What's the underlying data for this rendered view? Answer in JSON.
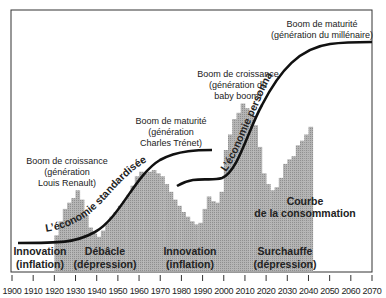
{
  "chart_data": {
    "type": "area",
    "title": "",
    "xlabel": "",
    "ylabel": "",
    "x_axis": {
      "range": [
        1900,
        2070
      ],
      "ticks": [
        1900,
        1910,
        1920,
        1930,
        1940,
        1950,
        1960,
        1970,
        1980,
        1990,
        2000,
        2010,
        2020,
        2030,
        2040,
        2050,
        2060,
        2070
      ],
      "tick_labels": [
        "1900",
        "1910",
        "1920",
        "1930",
        "1940",
        "1950",
        "1960",
        "1970",
        "1980",
        "1990",
        "2000",
        "2010",
        "2020",
        "2030",
        "2040",
        "2050",
        "2060",
        "2070"
      ]
    },
    "grid": false,
    "series": [
      {
        "name": "Courbe de la consommation",
        "kind": "stepped-area",
        "color": "#a8a8a8",
        "note": "relative height (0-100), read visually",
        "x": [
          1920,
          1922,
          1924,
          1926,
          1928,
          1930,
          1932,
          1934,
          1936,
          1938,
          1940,
          1942,
          1944,
          1946,
          1948,
          1950,
          1952,
          1954,
          1956,
          1958,
          1960,
          1962,
          1964,
          1966,
          1968,
          1970,
          1972,
          1974,
          1976,
          1978,
          1980,
          1982,
          1984,
          1986,
          1988,
          1990,
          1992,
          1994,
          1996,
          1998,
          2000,
          2002,
          2004,
          2006,
          2008,
          2010,
          2012,
          2014,
          2016,
          2018,
          2020,
          2022,
          2024,
          2026,
          2028,
          2030,
          2032,
          2034,
          2036,
          2038,
          2040
        ],
        "values": [
          5,
          14,
          22,
          26,
          29,
          34,
          28,
          18,
          10,
          6,
          4,
          8,
          13,
          17,
          20,
          24,
          27,
          31,
          37,
          43,
          46,
          45,
          46,
          47,
          45,
          43,
          38,
          33,
          28,
          24,
          20,
          17,
          14,
          12,
          13,
          22,
          30,
          27,
          26,
          33,
          60,
          70,
          80,
          84,
          90,
          87,
          84,
          76,
          62,
          45,
          38,
          34,
          36,
          42,
          51,
          54,
          56,
          63,
          66,
          70,
          75
        ]
      },
      {
        "name": "L'économie standardisée",
        "kind": "s-curve",
        "color": "#111111",
        "x": [
          1903,
          1915,
          1925,
          1935,
          1945,
          1955,
          1965,
          1975,
          1985,
          1991
        ],
        "values": [
          4,
          5,
          8,
          16,
          32,
          48,
          56,
          58,
          58,
          58
        ]
      },
      {
        "name": "L'économie personnalisée",
        "kind": "s-curve",
        "color": "#111111",
        "x": [
          1972,
          1980,
          1990,
          2000,
          2010,
          2020,
          2030,
          2040,
          2050,
          2060,
          2068
        ],
        "values": [
          30,
          27,
          30,
          40,
          58,
          80,
          98,
          110,
          116,
          118,
          118
        ]
      }
    ],
    "annotations": [
      {
        "text": "Boom de croissance (génération Louis Renault)",
        "x": 1930
      },
      {
        "text": "Boom de maturité (génération Charles Trénet)",
        "x": 1968
      },
      {
        "text": "Boom de croissance (génération du baby boom)",
        "x": 2006
      },
      {
        "text": "Boom de maturité (génération du millénaire)",
        "x": 2054
      },
      {
        "text": "Innovation (inflation)",
        "x": 1910
      },
      {
        "text": "Débâcle (dépression)",
        "x": 1938
      },
      {
        "text": "Innovation (inflation)",
        "x": 1980
      },
      {
        "text": "Surchauffe (dépression)",
        "x": 2031
      },
      {
        "text": "Courbe de la consommation",
        "x": 2042
      }
    ]
  },
  "labels": {
    "boom1": [
      "Boom de croissance",
      "(génération",
      "Louis Renault)"
    ],
    "boom2": [
      "Boom de maturité",
      "(génération",
      "Charles Trénet)"
    ],
    "boom3": [
      "Boom de croissance",
      "(génération du",
      "baby boom)"
    ],
    "boom4": [
      "Boom de maturité",
      "(génération du millénaire)"
    ],
    "phase1": [
      "Innovation",
      "(inflation)"
    ],
    "phase2": [
      "Débâcle",
      "(dépression)"
    ],
    "phase3": [
      "Innovation",
      "(inflation)"
    ],
    "phase4": [
      "Surchauffe",
      "(dépression)"
    ],
    "consumption": [
      "Courbe",
      "de la consommation"
    ],
    "curve_standard": "L’économie standardisée",
    "curve_personal": "L’économie personnalisée"
  },
  "colors": {
    "bars": "#a9a9a9",
    "curve": "#111111",
    "frame": "#333333",
    "text": "#222222"
  }
}
